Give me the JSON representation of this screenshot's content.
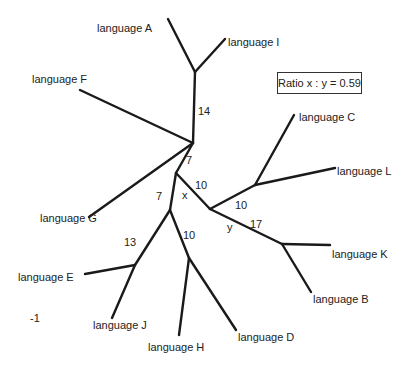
{
  "diagram": {
    "type": "unrooted phylogenetic tree",
    "ratio_label": "Ratio x : y = 0.59",
    "leaves": [
      {
        "id": "A",
        "label": "language A"
      },
      {
        "id": "I",
        "label": "language I"
      },
      {
        "id": "F",
        "label": "language F"
      },
      {
        "id": "C",
        "label": "language C"
      },
      {
        "id": "L",
        "label": "language L"
      },
      {
        "id": "G",
        "label": "language G"
      },
      {
        "id": "K",
        "label": "language K"
      },
      {
        "id": "E",
        "label": "language E"
      },
      {
        "id": "B",
        "label": "language B"
      },
      {
        "id": "J",
        "label": "language J"
      },
      {
        "id": "H",
        "label": "language H"
      },
      {
        "id": "D",
        "label": "language D"
      }
    ],
    "branch_labels": {
      "b14": "14",
      "b7_upper": "7",
      "x": "x",
      "b10_x": "10",
      "b7_left": "7",
      "b10_right": "10",
      "y": "y",
      "b17": "17",
      "b13": "13",
      "b10_lower": "10"
    },
    "scale_marker": "-1",
    "line_color": "#1a1a1a"
  }
}
